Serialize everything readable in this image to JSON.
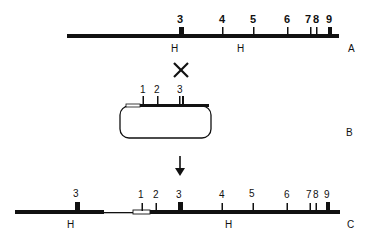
{
  "diagram": {
    "type": "genetic recombination / integration map",
    "rows": {
      "A": {
        "label": "A",
        "markers": [
          {
            "label": "3",
            "x": 181,
            "type": "block"
          },
          {
            "label": "4",
            "x": 223,
            "type": "tick"
          },
          {
            "label": "5",
            "x": 254,
            "type": "tick"
          },
          {
            "label": "6",
            "x": 288,
            "type": "tick"
          },
          {
            "label": "7",
            "x": 311,
            "type": "tick"
          },
          {
            "label": "8",
            "x": 317,
            "type": "tick"
          },
          {
            "label": "9",
            "x": 330,
            "type": "block"
          }
        ],
        "below_labels": [
          {
            "label": "H",
            "x": 174
          },
          {
            "label": "H",
            "x": 240
          }
        ]
      },
      "cross": {
        "symbol": "✕"
      },
      "B": {
        "label": "B",
        "markers": [
          {
            "label": "1",
            "x": 143
          },
          {
            "label": "2",
            "x": 157
          },
          {
            "label": "3",
            "x": 180
          }
        ]
      },
      "arrow": {
        "symbol": "↓"
      },
      "C": {
        "label": "C",
        "markers": [
          {
            "label": "3",
            "x": 77,
            "type": "block"
          },
          {
            "label": "1",
            "x": 142,
            "type": "tick"
          },
          {
            "label": "2",
            "x": 156,
            "type": "tick"
          },
          {
            "label": "3",
            "x": 180,
            "type": "block"
          },
          {
            "label": "4",
            "x": 222,
            "type": "tick"
          },
          {
            "label": "5",
            "x": 253,
            "type": "tick"
          },
          {
            "label": "6",
            "x": 287,
            "type": "tick"
          },
          {
            "label": "7",
            "x": 310,
            "type": "tick"
          },
          {
            "label": "8",
            "x": 316,
            "type": "tick"
          },
          {
            "label": "9",
            "x": 328,
            "type": "block"
          }
        ],
        "below_labels": [
          {
            "label": "H",
            "x": 70
          },
          {
            "label": "H",
            "x": 228
          }
        ]
      }
    }
  }
}
